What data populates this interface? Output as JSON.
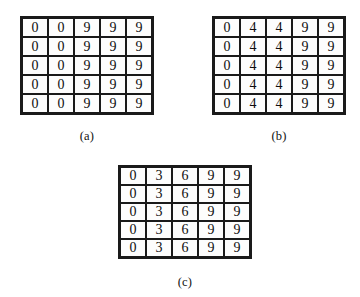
{
  "figure": {
    "background_color": "#ffffff",
    "grid_line_color": "#1a1a1a",
    "cell_fill_color": "#fdfdfd",
    "text_color": "#0d0d0d",
    "panels": [
      {
        "id": "a",
        "caption": "(a)",
        "rows": 5,
        "cols": 5,
        "values": [
          [
            "0",
            "0",
            "9",
            "9",
            "9"
          ],
          [
            "0",
            "0",
            "9",
            "9",
            "9"
          ],
          [
            "0",
            "0",
            "9",
            "9",
            "9"
          ],
          [
            "0",
            "0",
            "9",
            "9",
            "9"
          ],
          [
            "0",
            "0",
            "9",
            "9",
            "9"
          ]
        ]
      },
      {
        "id": "b",
        "caption": "(b)",
        "rows": 5,
        "cols": 5,
        "values": [
          [
            "0",
            "4",
            "4",
            "9",
            "9"
          ],
          [
            "0",
            "4",
            "4",
            "9",
            "9"
          ],
          [
            "0",
            "4",
            "4",
            "9",
            "9"
          ],
          [
            "0",
            "4",
            "4",
            "9",
            "9"
          ],
          [
            "0",
            "4",
            "4",
            "9",
            "9"
          ]
        ]
      },
      {
        "id": "c",
        "caption": "(c)",
        "rows": 5,
        "cols": 5,
        "values": [
          [
            "0",
            "3",
            "6",
            "9",
            "9"
          ],
          [
            "0",
            "3",
            "6",
            "9",
            "9"
          ],
          [
            "0",
            "3",
            "6",
            "9",
            "9"
          ],
          [
            "0",
            "3",
            "6",
            "9",
            "9"
          ],
          [
            "0",
            "3",
            "6",
            "9",
            "9"
          ]
        ]
      }
    ]
  }
}
